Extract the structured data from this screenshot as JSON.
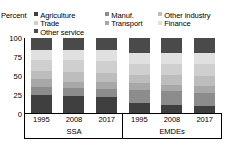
{
  "axis_unit_label": "Percent",
  "legend": {
    "items": [
      {
        "label": "Agriculture",
        "color": "#3f3f3f"
      },
      {
        "label": "Manuf.",
        "color": "#8c8c8c"
      },
      {
        "label": "Other industry",
        "color": "#bdbdbd"
      },
      {
        "label": "Trade",
        "color": "#cfcfcf"
      },
      {
        "label": "Transport",
        "color": "#a8a8a8"
      },
      {
        "label": "Finance",
        "color": "#e0e0e0"
      },
      {
        "label": "Other service",
        "color": "#4a4a4a"
      }
    ]
  },
  "chart_data": {
    "type": "bar",
    "title": "",
    "xlabel": "",
    "ylabel": "Percent",
    "ylim": [
      0,
      100
    ],
    "yticks": [
      0,
      25,
      50,
      75,
      100
    ],
    "grid": false,
    "legend_position": "top",
    "stacked": true,
    "groups": [
      {
        "name": "SSA",
        "categories": [
          "1995",
          "2008",
          "2017"
        ]
      },
      {
        "name": "EMDEs",
        "categories": [
          "1995",
          "2008",
          "2017"
        ]
      }
    ],
    "categories": [
      "1995",
      "2008",
      "2017",
      "1995",
      "2008",
      "2017"
    ],
    "series": [
      {
        "name": "Agriculture",
        "values": [
          24,
          23,
          22,
          13,
          11,
          10
        ]
      },
      {
        "name": "Manuf.",
        "values": [
          11,
          10,
          10,
          18,
          18,
          17
        ]
      },
      {
        "name": "Transport",
        "values": [
          10,
          9,
          9,
          9,
          9,
          9
        ]
      },
      {
        "name": "Other industry",
        "values": [
          11,
          13,
          13,
          11,
          13,
          13
        ]
      },
      {
        "name": "Trade",
        "values": [
          15,
          16,
          16,
          15,
          15,
          16
        ]
      },
      {
        "name": "Finance",
        "values": [
          13,
          13,
          14,
          14,
          14,
          15
        ]
      },
      {
        "name": "Other service",
        "values": [
          16,
          16,
          16,
          20,
          20,
          20
        ]
      }
    ]
  },
  "ytick_labels": [
    "100",
    "75",
    "50",
    "25",
    "0"
  ],
  "x_labels": [
    "1995",
    "2008",
    "2017",
    "1995",
    "2008",
    "2017"
  ],
  "group_labels": [
    "SSA",
    "EMDEs"
  ]
}
